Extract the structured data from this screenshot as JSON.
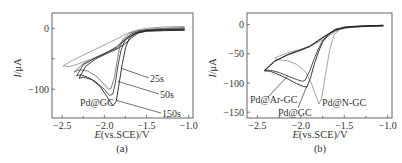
{
  "chart_data": [
    {
      "type": "line",
      "panel_label": "(a)",
      "xlabel_italic": "E",
      "xlabel_rest": "(vs.SCE)/V",
      "ylabel_italic": "I",
      "ylabel_rest": "/μA",
      "xlim": [
        -2.62,
        -0.95
      ],
      "ylim": [
        -147,
        25
      ],
      "xticks": [
        -2.5,
        -2.0,
        -1.5,
        -1.0
      ],
      "xtick_labels": [
        "−2.5",
        "−2.0",
        "−1.5",
        "−1.0"
      ],
      "yticks": [
        0,
        -50,
        -100
      ],
      "ytick_labels": [
        "0",
        "",
        "−100"
      ],
      "annotation": "Pd@GC",
      "series": [
        {
          "name": "Pd@GC",
          "color": "#9a9a9a",
          "label": "",
          "points": [
            [
              -1.05,
              3
            ],
            [
              -1.3,
              2
            ],
            [
              -1.5,
              0
            ],
            [
              -1.62,
              -3
            ],
            [
              -1.72,
              -8
            ],
            [
              -1.82,
              -15
            ],
            [
              -1.95,
              -24
            ],
            [
              -2.1,
              -34
            ],
            [
              -2.25,
              -44
            ],
            [
              -2.4,
              -54
            ],
            [
              -2.49,
              -62
            ],
            [
              -2.42,
              -63
            ],
            [
              -2.3,
              -58
            ],
            [
              -2.15,
              -50
            ],
            [
              -2.0,
              -42
            ],
            [
              -1.9,
              -34
            ],
            [
              -1.8,
              -24
            ],
            [
              -1.7,
              -14
            ],
            [
              -1.6,
              -6
            ],
            [
              -1.45,
              -2
            ],
            [
              -1.2,
              0
            ],
            [
              -1.05,
              1
            ]
          ]
        },
        {
          "name": "25s",
          "color": "#707070",
          "label": "25s",
          "label_anchor": [
            -1.79,
            -66
          ],
          "points": [
            [
              -1.05,
              1
            ],
            [
              -1.3,
              0
            ],
            [
              -1.5,
              -2
            ],
            [
              -1.6,
              -5
            ],
            [
              -1.7,
              -12
            ],
            [
              -1.78,
              -20
            ],
            [
              -1.85,
              -30
            ],
            [
              -1.95,
              -38
            ],
            [
              -2.1,
              -48
            ],
            [
              -2.25,
              -58
            ],
            [
              -2.36,
              -72
            ],
            [
              -2.3,
              -68
            ],
            [
              -2.2,
              -70
            ],
            [
              -2.1,
              -78
            ],
            [
              -2.0,
              -92
            ],
            [
              -1.95,
              -100
            ],
            [
              -1.92,
              -98
            ],
            [
              -1.88,
              -80
            ],
            [
              -1.85,
              -55
            ],
            [
              -1.82,
              -32
            ],
            [
              -1.78,
              -18
            ],
            [
              -1.7,
              -8
            ],
            [
              -1.6,
              -4
            ],
            [
              -1.45,
              -2
            ],
            [
              -1.2,
              -1
            ],
            [
              -1.05,
              -1
            ]
          ]
        },
        {
          "name": "50s",
          "color": "#3a3a3a",
          "label": "50s",
          "label_anchor": [
            -1.84,
            -87
          ],
          "points": [
            [
              -1.05,
              -1
            ],
            [
              -1.3,
              -2
            ],
            [
              -1.5,
              -3
            ],
            [
              -1.6,
              -6
            ],
            [
              -1.7,
              -14
            ],
            [
              -1.78,
              -22
            ],
            [
              -1.85,
              -32
            ],
            [
              -1.95,
              -38
            ],
            [
              -2.1,
              -48
            ],
            [
              -2.25,
              -60
            ],
            [
              -2.33,
              -78
            ],
            [
              -2.28,
              -76
            ],
            [
              -2.2,
              -80
            ],
            [
              -2.1,
              -88
            ],
            [
              -2.0,
              -100
            ],
            [
              -1.94,
              -110
            ],
            [
              -1.9,
              -108
            ],
            [
              -1.87,
              -90
            ],
            [
              -1.84,
              -62
            ],
            [
              -1.8,
              -35
            ],
            [
              -1.75,
              -18
            ],
            [
              -1.68,
              -9
            ],
            [
              -1.55,
              -4
            ],
            [
              -1.3,
              -2
            ],
            [
              -1.05,
              -2
            ]
          ]
        },
        {
          "name": "150s",
          "color": "#222222",
          "label": "150s",
          "label_anchor": [
            -1.86,
            -118
          ],
          "points": [
            [
              -1.05,
              -3
            ],
            [
              -1.3,
              -3
            ],
            [
              -1.5,
              -4
            ],
            [
              -1.6,
              -8
            ],
            [
              -1.68,
              -16
            ],
            [
              -1.76,
              -26
            ],
            [
              -1.85,
              -34
            ],
            [
              -1.95,
              -40
            ],
            [
              -2.1,
              -50
            ],
            [
              -2.22,
              -62
            ],
            [
              -2.3,
              -82
            ],
            [
              -2.25,
              -80
            ],
            [
              -2.15,
              -84
            ],
            [
              -2.05,
              -95
            ],
            [
              -1.97,
              -112
            ],
            [
              -1.9,
              -127
            ],
            [
              -1.86,
              -120
            ],
            [
              -1.83,
              -95
            ],
            [
              -1.79,
              -60
            ],
            [
              -1.75,
              -32
            ],
            [
              -1.7,
              -15
            ],
            [
              -1.62,
              -8
            ],
            [
              -1.5,
              -5
            ],
            [
              -1.3,
              -4
            ],
            [
              -1.05,
              -3
            ]
          ]
        }
      ]
    },
    {
      "type": "line",
      "panel_label": "(b)",
      "xlabel_italic": "E",
      "xlabel_rest": "(vs.SCE)/V",
      "ylabel_italic": "I",
      "ylabel_rest": "/μA",
      "xlim": [
        -2.62,
        -0.95
      ],
      "ylim": [
        -160,
        20
      ],
      "xticks": [
        -2.5,
        -2.0,
        -1.5,
        -1.0
      ],
      "xtick_labels": [
        "−2.5",
        "−2.0",
        "−1.5",
        "−1.0"
      ],
      "yticks": [
        0,
        -50,
        -100,
        -150
      ],
      "ytick_labels": [
        "0",
        "−50",
        "−100",
        "−150"
      ],
      "series": [
        {
          "name": "Pd@N-GC",
          "color": "#9a9a9a",
          "label": "Pd@N-GC",
          "points": [
            [
              -1.05,
              -2
            ],
            [
              -1.3,
              -3
            ],
            [
              -1.45,
              -5
            ],
            [
              -1.55,
              -8
            ],
            [
              -1.62,
              -14
            ],
            [
              -1.7,
              -22
            ],
            [
              -1.8,
              -30
            ],
            [
              -1.9,
              -37
            ],
            [
              -2.0,
              -42
            ],
            [
              -2.15,
              -48
            ],
            [
              -2.3,
              -57
            ],
            [
              -2.27,
              -60
            ],
            [
              -2.15,
              -62
            ],
            [
              -2.05,
              -68
            ],
            [
              -1.95,
              -80
            ],
            [
              -1.88,
              -100
            ],
            [
              -1.82,
              -125
            ],
            [
              -1.79,
              -136
            ],
            [
              -1.76,
              -125
            ],
            [
              -1.72,
              -90
            ],
            [
              -1.67,
              -45
            ],
            [
              -1.62,
              -18
            ],
            [
              -1.55,
              -8
            ],
            [
              -1.4,
              -4
            ],
            [
              -1.2,
              -3
            ],
            [
              -1.05,
              -2
            ]
          ]
        },
        {
          "name": "Pd@Ar-GC",
          "color": "#3a3a3a",
          "label": "Pd@Ar-GC",
          "label_anchor": [
            -2.15,
            -88
          ],
          "points": [
            [
              -1.05,
              -2
            ],
            [
              -1.3,
              -3
            ],
            [
              -1.5,
              -5
            ],
            [
              -1.6,
              -10
            ],
            [
              -1.7,
              -18
            ],
            [
              -1.8,
              -28
            ],
            [
              -1.9,
              -38
            ],
            [
              -2.0,
              -44
            ],
            [
              -2.15,
              -52
            ],
            [
              -2.3,
              -62
            ],
            [
              -2.42,
              -78
            ],
            [
              -2.35,
              -78
            ],
            [
              -2.25,
              -82
            ],
            [
              -2.15,
              -88
            ],
            [
              -2.05,
              -94
            ],
            [
              -1.98,
              -97
            ],
            [
              -1.95,
              -95
            ],
            [
              -1.9,
              -80
            ],
            [
              -1.85,
              -60
            ],
            [
              -1.8,
              -42
            ],
            [
              -1.75,
              -28
            ],
            [
              -1.68,
              -16
            ],
            [
              -1.6,
              -8
            ],
            [
              -1.45,
              -4
            ],
            [
              -1.2,
              -3
            ],
            [
              -1.05,
              -2
            ]
          ]
        },
        {
          "name": "Pd@GC",
          "color": "#222222",
          "label": "Pd@GC",
          "label_anchor": [
            -1.93,
            -105
          ],
          "points": [
            [
              -1.05,
              -1
            ],
            [
              -1.3,
              -2
            ],
            [
              -1.5,
              -4
            ],
            [
              -1.6,
              -9
            ],
            [
              -1.7,
              -17
            ],
            [
              -1.8,
              -27
            ],
            [
              -1.9,
              -37
            ],
            [
              -2.0,
              -43
            ],
            [
              -2.15,
              -51
            ],
            [
              -2.3,
              -63
            ],
            [
              -2.42,
              -79
            ],
            [
              -2.35,
              -80
            ],
            [
              -2.25,
              -86
            ],
            [
              -2.15,
              -93
            ],
            [
              -2.05,
              -101
            ],
            [
              -1.97,
              -106
            ],
            [
              -1.93,
              -107
            ],
            [
              -1.89,
              -92
            ],
            [
              -1.85,
              -70
            ],
            [
              -1.8,
              -48
            ],
            [
              -1.75,
              -30
            ],
            [
              -1.68,
              -17
            ],
            [
              -1.6,
              -8
            ],
            [
              -1.45,
              -4
            ],
            [
              -1.2,
              -2
            ],
            [
              -1.05,
              -1
            ]
          ]
        }
      ]
    }
  ]
}
